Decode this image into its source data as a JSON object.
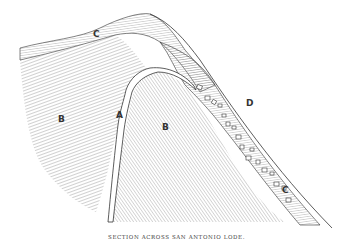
{
  "figure": {
    "caption": "SECTION ACROSS SAN ANTONIO LODE.",
    "labels": {
      "A": "A",
      "B_left": "B",
      "B_right": "B",
      "C_top": "C",
      "C_bottom": "C",
      "D": "D"
    },
    "colors": {
      "ink": "#333333",
      "hatch": "#7a7a7a",
      "background": "#ffffff"
    }
  }
}
